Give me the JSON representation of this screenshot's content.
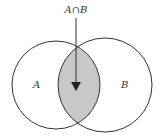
{
  "diagram": {
    "type": "venn",
    "sets": [
      {
        "label": "A"
      },
      {
        "label": "B"
      }
    ],
    "intersection_label": "A∩B",
    "colors": {
      "stroke": "#333333",
      "intersection_fill": "#c8c8c8",
      "background": "#ffffff"
    }
  }
}
